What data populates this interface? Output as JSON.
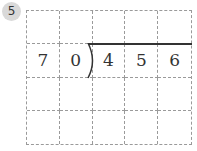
{
  "problem": {
    "number": "5",
    "divisor": [
      "7",
      "0"
    ],
    "dividend": [
      "4",
      "5",
      "6"
    ],
    "rows": 4,
    "cols": 5,
    "grid": [
      [
        "",
        "",
        "",
        "",
        ""
      ],
      [
        "7",
        "0",
        "4",
        "5",
        "6"
      ],
      [
        "",
        "",
        "",
        "",
        ""
      ],
      [
        "",
        "",
        "",
        "",
        ""
      ]
    ]
  }
}
